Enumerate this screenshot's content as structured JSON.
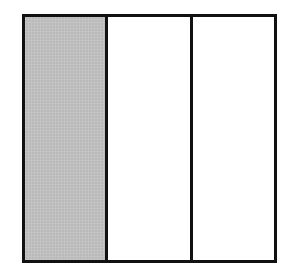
{
  "figure": {
    "kind": "geometric-diagram",
    "canvas": {
      "width": 294,
      "height": 275,
      "background_color": "#ffffff"
    },
    "outer_rectangle": {
      "x": 22,
      "y": 14,
      "width": 255,
      "height": 249,
      "border_color": "#111111",
      "border_width": 3,
      "fill_color": "#ffffff"
    },
    "dividers": [
      {
        "id": "divider-1",
        "orientation": "vertical",
        "x": 105,
        "width": 3,
        "color": "#111111"
      },
      {
        "id": "divider-2",
        "orientation": "vertical",
        "x": 190,
        "width": 3,
        "color": "#111111"
      }
    ],
    "panels": [
      {
        "id": "panel-left",
        "position": "left",
        "label": "",
        "fill": "shaded",
        "fill_color": "#c2c2c2",
        "width": 80
      },
      {
        "id": "panel-middle",
        "position": "middle",
        "label": "",
        "fill": "empty",
        "fill_color": "#ffffff",
        "width": 82
      },
      {
        "id": "panel-right",
        "position": "right",
        "label": "",
        "fill": "empty",
        "fill_color": "#ffffff",
        "width": 84
      }
    ]
  }
}
